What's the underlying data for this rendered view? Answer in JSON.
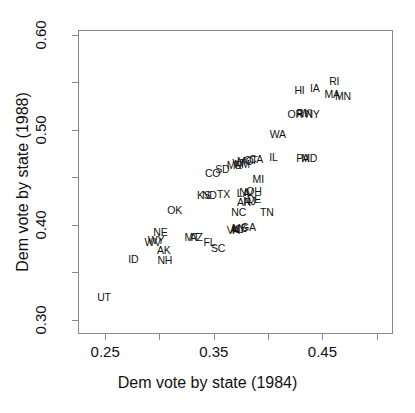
{
  "chart_data": {
    "type": "scatter",
    "title": "",
    "subtitle": "",
    "xlabel": "Dem vote by state (1984)",
    "ylabel": "Dem vote by state (1988)",
    "xlim": [
      0.225,
      0.515
    ],
    "ylim": [
      0.285,
      0.605
    ],
    "grid": false,
    "legend": "none",
    "marker_style": "text-label",
    "x_ticks_major": [
      "0.25",
      "0.35",
      "0.45"
    ],
    "x_ticks_major_values": [
      0.25,
      0.35,
      0.45
    ],
    "x_ticks_minor_values": [
      0.3,
      0.4,
      0.5
    ],
    "y_ticks_major": [
      "0.30",
      "0.40",
      "0.50",
      "0.60"
    ],
    "y_ticks_major_values": [
      0.3,
      0.4,
      0.5,
      0.6
    ],
    "y_ticks_minor_values": [
      0.35,
      0.45,
      0.55
    ],
    "point_label_key": "state abbreviation",
    "points": [
      {
        "label": "UT",
        "x": 0.248,
        "y": 0.325
      },
      {
        "label": "ID",
        "x": 0.275,
        "y": 0.365
      },
      {
        "label": "NH",
        "x": 0.304,
        "y": 0.364
      },
      {
        "label": "AK",
        "x": 0.303,
        "y": 0.374
      },
      {
        "label": "WV",
        "x": 0.293,
        "y": 0.383
      },
      {
        "label": "WY",
        "x": 0.296,
        "y": 0.385
      },
      {
        "label": "NE",
        "x": 0.3,
        "y": 0.393
      },
      {
        "label": "MT",
        "x": 0.329,
        "y": 0.388
      },
      {
        "label": "AZ",
        "x": 0.333,
        "y": 0.388
      },
      {
        "label": "FL",
        "x": 0.345,
        "y": 0.383
      },
      {
        "label": "SC",
        "x": 0.353,
        "y": 0.377
      },
      {
        "label": "OK",
        "x": 0.313,
        "y": 0.417
      },
      {
        "label": "KS",
        "x": 0.34,
        "y": 0.432
      },
      {
        "label": "ND",
        "x": 0.345,
        "y": 0.432
      },
      {
        "label": "TX",
        "x": 0.358,
        "y": 0.433
      },
      {
        "label": "VA",
        "x": 0.367,
        "y": 0.396
      },
      {
        "label": "AL",
        "x": 0.37,
        "y": 0.397
      },
      {
        "label": "KY",
        "x": 0.372,
        "y": 0.397
      },
      {
        "label": "MS",
        "x": 0.373,
        "y": 0.398
      },
      {
        "label": "GA",
        "x": 0.381,
        "y": 0.399
      },
      {
        "label": "NC",
        "x": 0.372,
        "y": 0.414
      },
      {
        "label": "TN",
        "x": 0.398,
        "y": 0.415
      },
      {
        "label": "AR",
        "x": 0.377,
        "y": 0.425
      },
      {
        "label": "NJ",
        "x": 0.382,
        "y": 0.426
      },
      {
        "label": "DE",
        "x": 0.386,
        "y": 0.428
      },
      {
        "label": "LA",
        "x": 0.376,
        "y": 0.435
      },
      {
        "label": "NV",
        "x": 0.379,
        "y": 0.436
      },
      {
        "label": "OH",
        "x": 0.386,
        "y": 0.437
      },
      {
        "label": "MI",
        "x": 0.39,
        "y": 0.449
      },
      {
        "label": "CO",
        "x": 0.348,
        "y": 0.456
      },
      {
        "label": "SD",
        "x": 0.357,
        "y": 0.46
      },
      {
        "label": "ME",
        "x": 0.368,
        "y": 0.464
      },
      {
        "label": "VT",
        "x": 0.372,
        "y": 0.466
      },
      {
        "label": "NM",
        "x": 0.375,
        "y": 0.465
      },
      {
        "label": "MO",
        "x": 0.378,
        "y": 0.468
      },
      {
        "label": "CT",
        "x": 0.383,
        "y": 0.469
      },
      {
        "label": "CA",
        "x": 0.388,
        "y": 0.47
      },
      {
        "label": "IL",
        "x": 0.404,
        "y": 0.472
      },
      {
        "label": "PA",
        "x": 0.431,
        "y": 0.471
      },
      {
        "label": "MD",
        "x": 0.437,
        "y": 0.471
      },
      {
        "label": "WA",
        "x": 0.408,
        "y": 0.497
      },
      {
        "label": "OR",
        "x": 0.424,
        "y": 0.518
      },
      {
        "label": "RI",
        "x": 0.43,
        "y": 0.519
      },
      {
        "label": "WI",
        "x": 0.434,
        "y": 0.519
      },
      {
        "label": "NY",
        "x": 0.44,
        "y": 0.518
      },
      {
        "label": "HI",
        "x": 0.428,
        "y": 0.543
      },
      {
        "label": "IA",
        "x": 0.442,
        "y": 0.545
      },
      {
        "label": "MA",
        "x": 0.458,
        "y": 0.539
      },
      {
        "label": "MN",
        "x": 0.468,
        "y": 0.537
      },
      {
        "label": "RI2",
        "x": 0.46,
        "y": 0.552
      }
    ]
  }
}
